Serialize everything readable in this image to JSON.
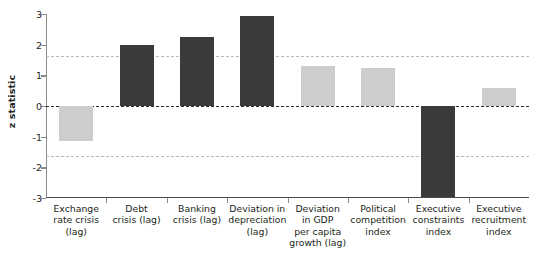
{
  "chart_data": {
    "type": "bar",
    "title": "",
    "xlabel": "",
    "ylabel": "z statistic",
    "ylim": [
      -3,
      3
    ],
    "yticks": [
      3,
      2,
      1,
      0,
      -1,
      -2,
      -3
    ],
    "ytick_labels": [
      "3",
      "2",
      "1",
      "0",
      "-1",
      "-2",
      "-3"
    ],
    "grid": false,
    "legend": "none",
    "reference_lines": [
      {
        "value": 1.645,
        "style": "dashed",
        "color": "#b9b9b9",
        "name": "upper-significance-threshold"
      },
      {
        "value": 0,
        "style": "dashed",
        "color": "#2e2e2e",
        "name": "zero-line"
      },
      {
        "value": -1.645,
        "style": "dashed",
        "color": "#b9b9b9",
        "name": "lower-significance-threshold"
      }
    ],
    "categories": [
      "Exchange rate crisis (lag)",
      "Debt crisis (lag)",
      "Banking crisis (lag)",
      "Deviation in depreciation (lag)",
      "Deviation in GDP per capita growth (lag)",
      "Political competition index",
      "Executive constraints index",
      "Executive recruitment index"
    ],
    "values": [
      -1.15,
      2.0,
      2.25,
      2.95,
      1.3,
      1.25,
      -3.2,
      0.6
    ],
    "clipped": [
      false,
      false,
      false,
      false,
      false,
      false,
      true,
      false
    ],
    "bar_colors": [
      "#cdcdcd",
      "#3a3a3a",
      "#3a3a3a",
      "#3a3a3a",
      "#cdcdcd",
      "#cdcdcd",
      "#3a3a3a",
      "#cdcdcd"
    ]
  },
  "category_lines": [
    [
      "Exchange",
      "rate crisis",
      "(lag)"
    ],
    [
      "Debt",
      "crisis (lag)"
    ],
    [
      "Banking",
      "crisis (lag)"
    ],
    [
      "Deviation in",
      "depreciation",
      "(lag)"
    ],
    [
      "Deviation",
      "in GDP",
      "per capita",
      "growth (lag)"
    ],
    [
      "Political",
      "competition",
      "index"
    ],
    [
      "Executive",
      "constraints",
      "index"
    ],
    [
      "Executive",
      "recruitment",
      "index"
    ]
  ],
  "colors": {
    "significant_bar": "#3a3a3a",
    "nonsignificant_bar": "#cdcdcd",
    "axis": "#8b8b8b",
    "zero_line": "#2e2e2e",
    "reference_line": "#b9b9b9",
    "text": "#231f20"
  }
}
